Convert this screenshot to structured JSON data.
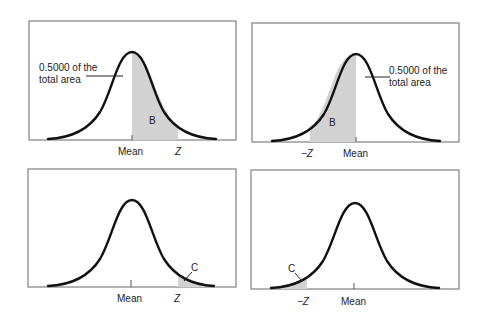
{
  "figure": {
    "colors": {
      "curve": "#111111",
      "shade": "#d2d2d2",
      "frame": "#8a8a8a",
      "text": "#222222",
      "background": "#ffffff"
    },
    "panels": [
      {
        "id": "top-left",
        "x_labels": {
          "mean": "Mean",
          "z": "Z"
        },
        "region_label": "B",
        "callout": {
          "line1": "0.5000 of the",
          "line2": "total area"
        },
        "shaded": "mean-to-z"
      },
      {
        "id": "top-right",
        "x_labels": {
          "mean": "Mean",
          "z": "−Z"
        },
        "region_label": "B",
        "callout": {
          "line1": "0.5000 of the",
          "line2": "total area"
        },
        "shaded": "negz-to-mean"
      },
      {
        "id": "bottom-left",
        "x_labels": {
          "mean": "Mean",
          "z": "Z"
        },
        "region_label": "C",
        "shaded": "right-tail-beyond-z"
      },
      {
        "id": "bottom-right",
        "x_labels": {
          "mean": "Mean",
          "z": "−Z"
        },
        "region_label": "C",
        "shaded": "left-tail-beyond-negz"
      }
    ]
  }
}
